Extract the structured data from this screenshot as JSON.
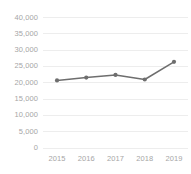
{
  "chart_data": {
    "type": "line",
    "title": "",
    "subtitle": "",
    "xlabel": "",
    "ylabel": "",
    "categories": [
      "2015",
      "2016",
      "2017",
      "2018",
      "2019"
    ],
    "series": [
      {
        "name": "series-1",
        "values": [
          20700,
          21600,
          22400,
          21000,
          26400
        ]
      }
    ],
    "ylim": [
      0,
      40000
    ],
    "yticks": [
      0,
      5000,
      10000,
      15000,
      20000,
      25000,
      30000,
      35000,
      40000
    ],
    "ytick_labels": [
      "0",
      "5,000",
      "10,000",
      "15,000",
      "20,000",
      "25,000",
      "30,000",
      "35,000",
      "40,000"
    ],
    "xtick_labels": [
      "2015",
      "2016",
      "2017",
      "2018",
      "2019"
    ],
    "grid": true,
    "grid_axis": "y",
    "legend": false,
    "legend_position": "none",
    "markers": true,
    "colors": {
      "line": "#6e6e6e",
      "marker": "#6e6e6e",
      "grid": "#ededed",
      "tick_label": "#a6a6a6",
      "background": "#ffffff"
    }
  }
}
